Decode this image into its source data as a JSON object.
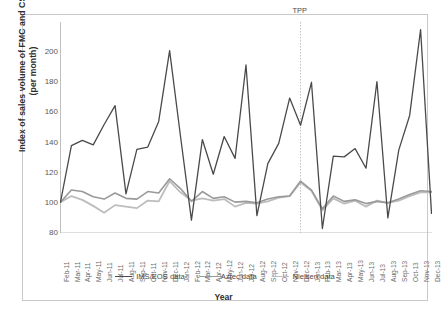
{
  "chart_data": {
    "type": "line",
    "title": "",
    "xlabel": "Year",
    "ylabel_line1": "Index of sales volume of FMC and CSE",
    "ylabel_line2": "(per month)",
    "ylim": [
      80,
      220
    ],
    "yticks": [
      80,
      100,
      120,
      140,
      160,
      180,
      200
    ],
    "grid": false,
    "legend_position": "bottom",
    "categories": [
      "Feb-11",
      "Mar-11",
      "Apr-11",
      "May-11",
      "Jun-11",
      "Jul-11",
      "Aug-11",
      "Sep-11",
      "Oct-11",
      "Nov-11",
      "Dec-11",
      "Jan-12",
      "Feb-12",
      "Mar-12",
      "Apr-12",
      "May-12",
      "Jun-12",
      "Jul-12",
      "Aug-12",
      "Sep-12",
      "Oct-12",
      "Nov-12",
      "Dec-12",
      "Jan-13",
      "Feb-13",
      "Mar-13",
      "Apr-13",
      "May-13",
      "Jun-13",
      "Jul-13",
      "Aug-13",
      "Sep-13",
      "Oct-13",
      "Nov-13",
      "Dec-13"
    ],
    "series": [
      {
        "name": "IMS/EOS data",
        "color": "#4a4a4a",
        "width": 1.3,
        "values": [
          100.5,
          138.0,
          141.5,
          138.5,
          152.0,
          164.5,
          106.0,
          135.5,
          137.0,
          154.0,
          201.0,
          144.0,
          88.5,
          142.0,
          119.0,
          144.0,
          129.5,
          191.5,
          91.5,
          126.0,
          139.5,
          169.5,
          151.5,
          180.0,
          83.0,
          131.0,
          130.5,
          136.0,
          123.0,
          180.5,
          90.0,
          135.0,
          158.0,
          215.0,
          93.0
        ]
      },
      {
        "name": "Aztec data",
        "color": "#9a9a9a",
        "width": 1.6,
        "values": [
          100.5,
          108.5,
          107.5,
          104.0,
          102.5,
          106.5,
          103.0,
          102.5,
          107.5,
          106.5,
          116.0,
          109.5,
          101.0,
          107.5,
          103.0,
          104.0,
          100.5,
          101.0,
          100.0,
          102.5,
          104.0,
          104.5,
          114.5,
          108.5,
          96.0,
          104.5,
          101.0,
          102.0,
          99.5,
          101.0,
          100.0,
          102.5,
          105.5,
          108.0,
          107.5
        ]
      },
      {
        "name": "Nielsen data",
        "color": "#bdbdbd",
        "width": 1.8,
        "values": [
          100.5,
          104.5,
          102.0,
          98.0,
          93.5,
          98.5,
          97.5,
          96.5,
          101.5,
          101.0,
          114.5,
          107.0,
          101.5,
          103.0,
          101.5,
          102.5,
          97.5,
          100.0,
          99.5,
          101.0,
          103.5,
          104.5,
          113.5,
          108.0,
          95.0,
          103.0,
          99.5,
          101.5,
          97.5,
          101.5,
          100.0,
          101.5,
          104.5,
          107.0,
          107.0
        ]
      }
    ],
    "annotations": [
      {
        "text": "TPP",
        "at_category": "Dec-12",
        "style": "dotted-vline"
      }
    ]
  },
  "legend": {
    "items": [
      {
        "label": "IMS/EOS data",
        "color": "#4a4a4a"
      },
      {
        "label": "Aztec data",
        "color": "#9a9a9a"
      },
      {
        "label": "Nielsen data",
        "color": "#bdbdbd"
      }
    ]
  }
}
